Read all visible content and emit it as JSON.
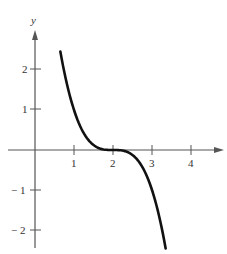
{
  "chart_data": {
    "type": "line",
    "title": "",
    "xlabel": "",
    "ylabel": "y",
    "function_shape": "f(x) = -(x-2)^3",
    "xlim": [
      0,
      4.8
    ],
    "ylim": [
      -2.5,
      3
    ],
    "grid": false,
    "x_ticks": [
      "1",
      "2",
      "3",
      "4"
    ],
    "y_ticks": [
      "2",
      "1",
      "-1",
      "-2"
    ],
    "series": [
      {
        "name": "curve",
        "x": [
          0.65,
          1.0,
          1.25,
          1.5,
          1.75,
          2.0,
          2.25,
          2.5,
          2.75,
          3.0,
          3.25,
          3.35
        ],
        "y": [
          2.46,
          1.0,
          0.42,
          0.125,
          0.016,
          0.0,
          -0.016,
          -0.125,
          -0.42,
          -1.0,
          -1.95,
          -2.46
        ]
      }
    ]
  },
  "axis": {
    "y_label": "y",
    "x_tick_labels": [
      "1",
      "2",
      "3",
      "4"
    ],
    "y_tick_labels": [
      "2",
      "1",
      "− 1",
      "− 2"
    ]
  }
}
